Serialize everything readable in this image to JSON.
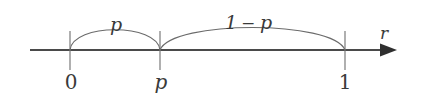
{
  "figure": {
    "type": "number-line-diagram",
    "background_color": "#ffffff",
    "line_color": "#4a4a4a",
    "arc_color": "#6b6b6b",
    "text_color": "#3a3a3a"
  },
  "axis": {
    "name": "r",
    "axis_label": "r",
    "start_x": 30,
    "end_x": 397,
    "y": 50,
    "arrow_label": "r"
  },
  "ticks": [
    {
      "id": "tick-zero",
      "label": "0",
      "x": 70,
      "italic": false
    },
    {
      "id": "tick-p",
      "label": "p",
      "x": 160,
      "italic": true
    },
    {
      "id": "tick-one",
      "label": "1",
      "x": 345,
      "italic": false
    }
  ],
  "arcs": [
    {
      "id": "arc-left",
      "label": "p",
      "label_parts": [
        "p"
      ],
      "from": "0",
      "to": "p",
      "from_x": 70,
      "to_x": 160,
      "peak_y": 24,
      "label_x": 116,
      "label_y": 31
    },
    {
      "id": "arc-right",
      "label": "1 − p",
      "label_parts": [
        "1",
        "−",
        "p"
      ],
      "from": "p",
      "to": "1",
      "from_x": 160,
      "to_x": 345,
      "peak_y": 22,
      "label_x": 252,
      "label_y": 29
    }
  ],
  "labels": {
    "arc_left_text": "p",
    "arc_right_one": "1",
    "arc_right_minus": "−",
    "arc_right_p": "p",
    "axis_arrow_text": "r",
    "tick_zero_text": "0",
    "tick_p_text": "p",
    "tick_one_text": "1"
  }
}
